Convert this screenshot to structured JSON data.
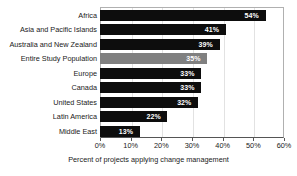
{
  "chart_data": {
    "type": "bar",
    "orientation": "horizontal",
    "title": "",
    "xlabel": "Percent of projects applying change management",
    "ylabel": "",
    "xlim": [
      0,
      60
    ],
    "xticks": [
      "0%",
      "10%",
      "20%",
      "30%",
      "40%",
      "50%",
      "60%"
    ],
    "xtick_values": [
      0,
      10,
      20,
      30,
      40,
      50,
      60
    ],
    "grid": true,
    "legend": "none",
    "categories": [
      "Africa",
      "Asia and Pacific Islands",
      "Australia and New Zealand",
      "Entire Study Population",
      "Europe",
      "Canada",
      "United States",
      "Latin America",
      "Middle East"
    ],
    "values": [
      54,
      41,
      39,
      35,
      33,
      33,
      32,
      22,
      13
    ],
    "data_labels": [
      "54%",
      "41%",
      "39%",
      "35%",
      "33%",
      "33%",
      "32%",
      "22%",
      "13%"
    ],
    "highlight_index": 3,
    "colors": {
      "bar": "#0d0d0d",
      "highlight_bar": "#808080",
      "data_label_text": "#ffffff",
      "gridline": "#e2e2e2",
      "axis": "#555555",
      "plot_border": "#b0b0b0",
      "background": "#ffffff",
      "text": "#1a1a1a"
    }
  }
}
